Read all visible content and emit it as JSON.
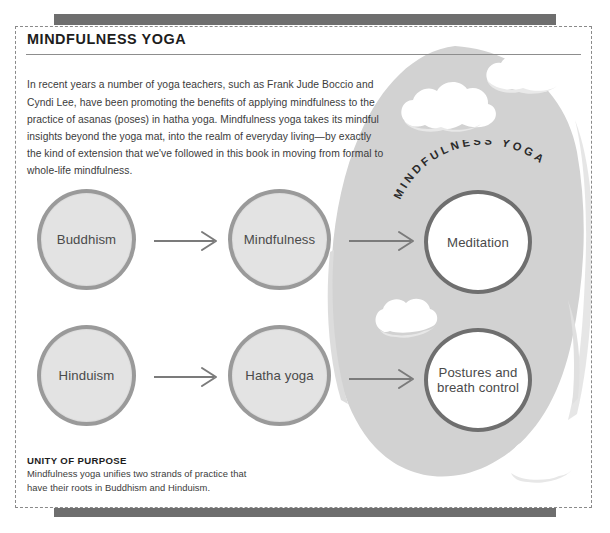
{
  "page": {
    "title": "MINDFULNESS YOGA",
    "intro": "In recent years a number of yoga teachers, such as Frank Jude Boccio and Cyndi Lee, have been promoting the benefits of applying mindfulness to the practice of asanas (poses) in hatha yoga. Mindfulness yoga takes its mindful insights beyond the yoga mat, into the realm of everyday living—by exactly the kind of extension that we've followed in this book in moving from formal to whole-life mindfulness."
  },
  "diagram": {
    "brush_label": "MINDFULNESS YOGA",
    "nodes": [
      {
        "id": "buddhism",
        "label": "Buddhism",
        "style": "gray",
        "row": 1,
        "col": 1
      },
      {
        "id": "mindfulness",
        "label": "Mindfulness",
        "style": "gray",
        "row": 1,
        "col": 2
      },
      {
        "id": "meditation",
        "label": "Meditation",
        "style": "white",
        "row": 1,
        "col": 3
      },
      {
        "id": "hinduism",
        "label": "Hinduism",
        "style": "gray",
        "row": 2,
        "col": 1
      },
      {
        "id": "hathayoga",
        "label": "Hatha yoga",
        "style": "gray",
        "row": 2,
        "col": 2
      },
      {
        "id": "postures",
        "label": "Postures and breath control",
        "style": "white",
        "row": 2,
        "col": 3
      }
    ],
    "arrows": [
      {
        "from": "buddhism",
        "to": "mindfulness"
      },
      {
        "from": "mindfulness",
        "to": "meditation"
      },
      {
        "from": "hinduism",
        "to": "hathayoga"
      },
      {
        "from": "hathayoga",
        "to": "postures"
      }
    ]
  },
  "caption": {
    "heading": "UNITY OF PURPOSE",
    "body": "Mindfulness yoga unifies two strands of practice that have their roots in Buddhism and Hinduism."
  },
  "colors": {
    "bar": "#6e6e6e",
    "blob": "#d2d2d2",
    "node_gray_fill": "#e3e3e3",
    "node_gray_stroke": "#9a9a9a",
    "node_white_fill": "#ffffff",
    "node_white_stroke": "#6f6f6f",
    "text": "#3b3b3b",
    "frame": "#8a8a8a"
  }
}
